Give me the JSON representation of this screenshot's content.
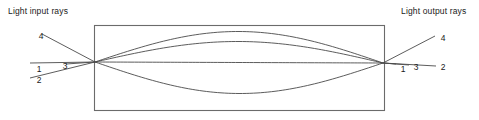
{
  "figure": {
    "input_label": "Light input rays",
    "output_label": "Light output rays",
    "background_color": "#ffffff",
    "line_color": "#4a4a4a",
    "text_color": "#1a1a1a"
  },
  "lens": {
    "name": "gradient-index-lens-body",
    "x": 94,
    "y": 25,
    "width": 290,
    "height": 85,
    "stroke": "#6b6b6b",
    "stroke_width": 1.1
  },
  "nodes": {
    "entrance_x": 95,
    "entrance_y": 62,
    "exit_x": 383,
    "exit_y": 63
  },
  "input_labels": [
    {
      "id": "4",
      "text": "4",
      "x": 36,
      "y": 31
    },
    {
      "id": "3",
      "text": "3",
      "x": 60,
      "y": 61
    },
    {
      "id": "1",
      "text": "1",
      "x": 34,
      "y": 64
    },
    {
      "id": "2",
      "text": "2",
      "x": 34,
      "y": 75
    }
  ],
  "output_labels": [
    {
      "id": "4",
      "text": "4",
      "x": 438,
      "y": 33
    },
    {
      "id": "3",
      "text": "3",
      "x": 411,
      "y": 62
    },
    {
      "id": "2",
      "text": "2",
      "x": 438,
      "y": 62
    },
    {
      "id": "1",
      "text": "1",
      "x": 398,
      "y": 64
    }
  ],
  "chart_data": {
    "type": "line",
    "xlabel": "",
    "ylabel": "",
    "xlim": [
      0,
      479
    ],
    "ylim": [
      120,
      0
    ],
    "grid": false,
    "legend": "none",
    "annotations": [
      "Light input rays",
      "Light output rays",
      "1",
      "2",
      "3",
      "4"
    ],
    "series": [
      {
        "name": "ray-1",
        "description": "On-axis ray: straight horizontal line through the lens axis",
        "input_segment": [
          [
            30,
            63
          ],
          [
            95,
            62
          ]
        ],
        "lens_path": [
          [
            95,
            62
          ],
          [
            239,
            63
          ],
          [
            383,
            63
          ]
        ],
        "output_segment": [
          [
            383,
            63
          ],
          [
            396,
            64
          ]
        ],
        "amplitude_px": 0
      },
      {
        "name": "ray-2",
        "description": "Enters from lower left rising; sinusoidal arc to top of lens; exits downward to the right",
        "input_segment": [
          [
            30,
            78
          ],
          [
            95,
            62
          ]
        ],
        "lens_path": [
          [
            95,
            62
          ],
          [
            239,
            31
          ],
          [
            383,
            63
          ]
        ],
        "output_segment": [
          [
            383,
            63
          ],
          [
            436,
            66
          ]
        ],
        "amplitude_px": -31
      },
      {
        "name": "ray-3",
        "description": "Enters nearly level; shallow sinusoidal arc above axis; exits slightly downward",
        "input_segment": [
          [
            66,
            64
          ],
          [
            95,
            62
          ]
        ],
        "lens_path": [
          [
            95,
            62
          ],
          [
            239,
            42
          ],
          [
            383,
            63
          ]
        ],
        "output_segment": [
          [
            383,
            63
          ],
          [
            409,
            65
          ]
        ],
        "amplitude_px": -21
      },
      {
        "name": "ray-4",
        "description": "Enters from upper left descending; sinusoidal arc to bottom of lens; exits upward to the right",
        "input_segment": [
          [
            42,
            34
          ],
          [
            95,
            62
          ]
        ],
        "lens_path": [
          [
            95,
            62
          ],
          [
            239,
            93
          ],
          [
            383,
            63
          ]
        ],
        "output_segment": [
          [
            383,
            63
          ],
          [
            435,
            36
          ]
        ],
        "amplitude_px": 31
      }
    ]
  }
}
